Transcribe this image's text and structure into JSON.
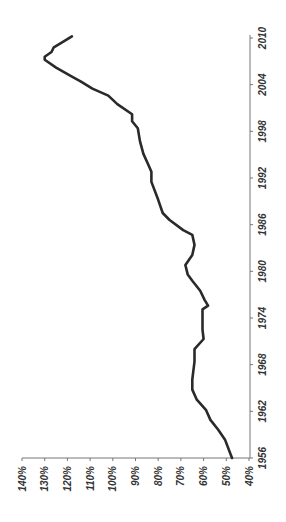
{
  "chart_data": {
    "type": "line",
    "orientation": "rotated-90-clockwise",
    "title": "",
    "xlabel": "",
    "ylabel": "",
    "x_ticks": [
      "1956",
      "1962",
      "1968",
      "1974",
      "1980",
      "1986",
      "1992",
      "1998",
      "2004",
      "2010"
    ],
    "y_ticks": [
      "40%",
      "50%",
      "60%",
      "70%",
      "80%",
      "90%",
      "100%",
      "110%",
      "120%",
      "130%",
      "140%"
    ],
    "xlim": [
      1956,
      2010
    ],
    "ylim": [
      40,
      140
    ],
    "grid": false,
    "legend": null,
    "series": [
      {
        "name": "ratio",
        "color": "#2a2a2a",
        "x": [
          1956.0,
          1958.3,
          1959.6,
          1960.9,
          1962.2,
          1963.5,
          1964.8,
          1966.1,
          1968.4,
          1970.0,
          1971.3,
          1972.5,
          1973.8,
          1975.1,
          1975.6,
          1976.3,
          1977.5,
          1978.8,
          1979.6,
          1980.8,
          1982.1,
          1983.4,
          1984.7,
          1985.3,
          1986.6,
          1987.5,
          1989.2,
          1991.5,
          1992.8,
          1993.8,
          1995.1,
          1996.7,
          1998.4,
          1999.3,
          2000.2,
          2001.5,
          2002.6,
          2003.5,
          2004.4,
          2005.2,
          2006.2,
          2007.2,
          2007.6,
          2008.2,
          2008.8,
          2009.5,
          2010.2
        ],
        "values": [
          47.5,
          50.5,
          53.5,
          57,
          59,
          63,
          65,
          65,
          64,
          64,
          60,
          60.5,
          60.5,
          60.5,
          58,
          59.5,
          61.5,
          65,
          67,
          68,
          65,
          64,
          65,
          69,
          75,
          78,
          80,
          83,
          83,
          84.5,
          86.5,
          88,
          89,
          91.5,
          91.5,
          98,
          102,
          109,
          114,
          119,
          125,
          130,
          130,
          127,
          126,
          122,
          118
        ]
      }
    ]
  }
}
